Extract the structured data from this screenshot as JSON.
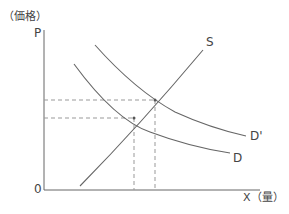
{
  "diagram": {
    "y_axis_title": "（価格）",
    "y_axis_label": "P",
    "x_axis_label": "X（量）",
    "origin_label": "0",
    "curves": [
      {
        "name": "S",
        "label": "S",
        "type": "supply"
      },
      {
        "name": "D",
        "label": "D",
        "type": "demand"
      },
      {
        "name": "D'",
        "label": "D'",
        "type": "demand-shifted"
      }
    ],
    "equilibria": [
      {
        "curves": [
          "S",
          "D"
        ],
        "x": 134,
        "y": 118
      },
      {
        "curves": [
          "S",
          "D'"
        ],
        "x": 155,
        "y": 100
      }
    ],
    "colors": {
      "line": "#666666",
      "dashed": "#999999",
      "text": "#444444"
    }
  }
}
